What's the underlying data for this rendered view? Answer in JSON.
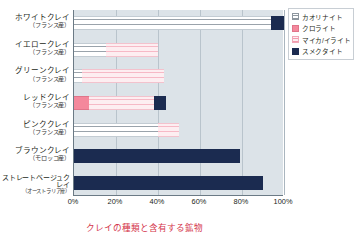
{
  "chart_data": {
    "type": "bar",
    "orientation": "horizontal",
    "stacked": true,
    "title": "",
    "xlabel": "",
    "ylabel": "",
    "xlim": [
      0,
      100
    ],
    "xticks": [
      0,
      20,
      40,
      60,
      80,
      100
    ],
    "xtick_labels": [
      "0%",
      "20%",
      "40%",
      "60%",
      "80%",
      "100%"
    ],
    "grid": true,
    "legend_position": "right",
    "categories": [
      "ホワイトクレイ",
      "イエロークレイ",
      "グリーンクレイ",
      "レッドクレイ",
      "ピンククレイ",
      "ブラウンクレイ",
      "ストレートベージュクレイ"
    ],
    "category_sublabels": [
      "（フランス産）",
      "（フランス産）",
      "（フランス産）",
      "（フランス産）",
      "（フランス産）",
      "（モロッコ産）",
      "（オーストラリア産）"
    ],
    "series": [
      {
        "name": "カオリナイト",
        "color": "#ffffff",
        "values": [
          94,
          15,
          4,
          0,
          40,
          0,
          0
        ]
      },
      {
        "name": "クロライト",
        "color": "#f4889c",
        "values": [
          0,
          0,
          0,
          7,
          0,
          0,
          0
        ]
      },
      {
        "name": "マイカ/イライト",
        "color": "#fdeef1",
        "values": [
          0,
          25,
          39,
          31,
          10,
          0,
          0
        ]
      },
      {
        "name": "スメクタイト",
        "color": "#1b2b50",
        "values": [
          6,
          0,
          0,
          6,
          0,
          79,
          90
        ]
      }
    ]
  },
  "legend": {
    "items": [
      {
        "label": "カオリナイト",
        "swatch": "kaolinite"
      },
      {
        "label": "クロライト",
        "swatch": "chlorite"
      },
      {
        "label": "マイカ/イライト",
        "swatch": "mica"
      },
      {
        "label": "スメクタイト",
        "swatch": "smectite"
      }
    ]
  },
  "caption": {
    "text": "クレイの種類と含有する鉱物"
  },
  "colors": {
    "plot_background": "#dce3e8",
    "gridline": "#b9c4cc",
    "axis": "#6b7a85",
    "caption_text": "#d4344a"
  }
}
